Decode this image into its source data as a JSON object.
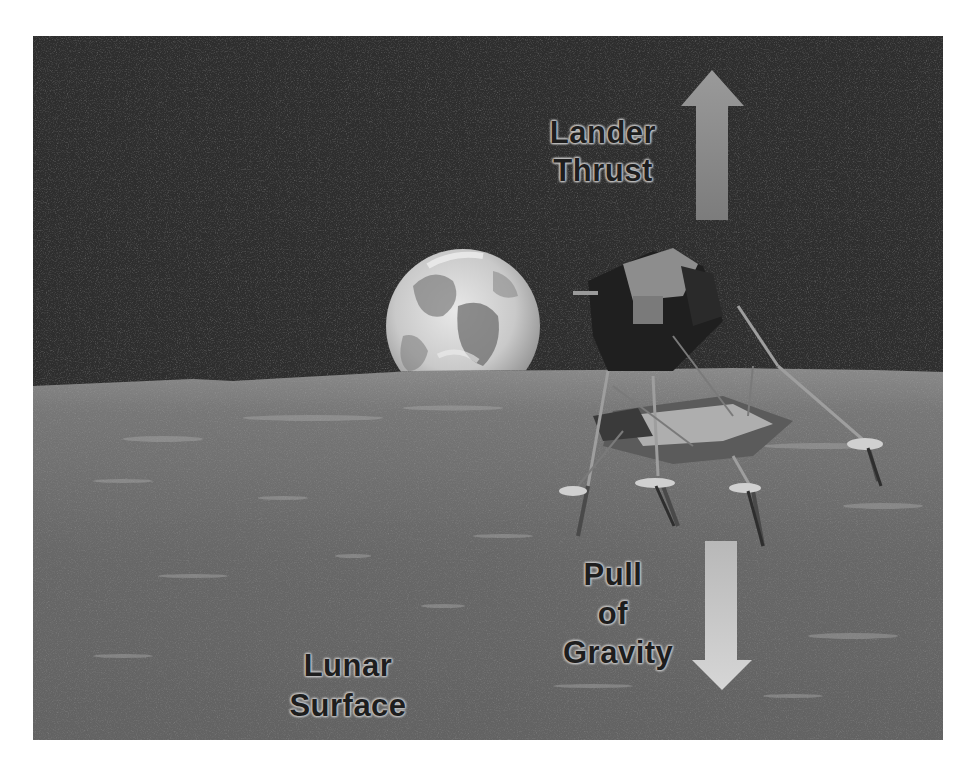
{
  "figure": {
    "colors": {
      "background": "#ffffff",
      "space": "#2e2e2e",
      "lunar_surface": "#6a6a6a",
      "arrow_up": "#8c8c8c",
      "arrow_down": "#c4c4c4",
      "label_text": "#1e1e1e",
      "label_halo": "#c0c0c0"
    }
  },
  "labels": {
    "thrust": {
      "line1": "Lander",
      "line2": "Thrust"
    },
    "gravity": {
      "line1": "Pull",
      "line2": "of",
      "line3": "Gravity"
    },
    "surface": {
      "line1": "Lunar",
      "line2": "Surface"
    }
  },
  "arrows": {
    "thrust": {
      "direction": "up",
      "meaning": "Lander Thrust"
    },
    "gravity": {
      "direction": "down",
      "meaning": "Pull of Gravity"
    }
  },
  "objects": {
    "earth": "earth-rise",
    "lander": "lunar-module"
  }
}
